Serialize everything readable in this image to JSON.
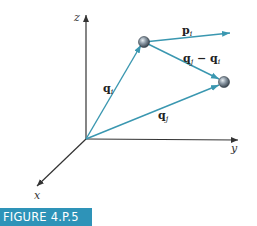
{
  "figure": {
    "caption": "FIGURE 4.P.5",
    "colors": {
      "vector": "#3a97b0",
      "axis": "#333333",
      "caption_bg": "#2e93b8",
      "particle": "#7a8896"
    },
    "axes": {
      "z": "z",
      "y": "y",
      "x": "x"
    },
    "vectors": {
      "q_i": {
        "base": "q",
        "sub": "i"
      },
      "q_j": {
        "base": "q",
        "sub": "j"
      },
      "p_i": {
        "base": "p",
        "sub": "i"
      },
      "diff": {
        "base1": "q",
        "sub1": "j",
        "op": " − ",
        "base2": "q",
        "sub2": "i"
      }
    },
    "particles": [
      "particle-i",
      "particle-j"
    ]
  }
}
